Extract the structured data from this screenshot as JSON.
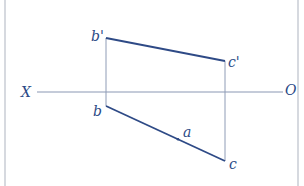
{
  "diagram": {
    "type": "orthographic-projection",
    "colors": {
      "line": "#2e4a86",
      "label": "#2b4a86",
      "axis": "#8a97b3",
      "frame": "#c9cdd4"
    },
    "axis": {
      "left_label": "X",
      "right_label": "O"
    },
    "points": {
      "b_prime": {
        "label": "b'",
        "x": 106,
        "y": 38
      },
      "c_prime": {
        "label": "c'",
        "x": 225,
        "y": 61
      },
      "b": {
        "label": "b",
        "x": 106,
        "y": 106
      },
      "c": {
        "label": "c",
        "x": 225,
        "y": 161
      },
      "a": {
        "label": "a",
        "x": 178,
        "y": 139
      }
    },
    "segments": [
      {
        "from": "b_prime",
        "to": "c_prime",
        "kind": "front-view-edge"
      },
      {
        "from": "b",
        "to": "c",
        "kind": "top-view-edge"
      },
      {
        "from": "b_prime",
        "to": "b",
        "kind": "projection-line"
      },
      {
        "from": "c_prime",
        "to": "c",
        "kind": "projection-line"
      }
    ]
  }
}
